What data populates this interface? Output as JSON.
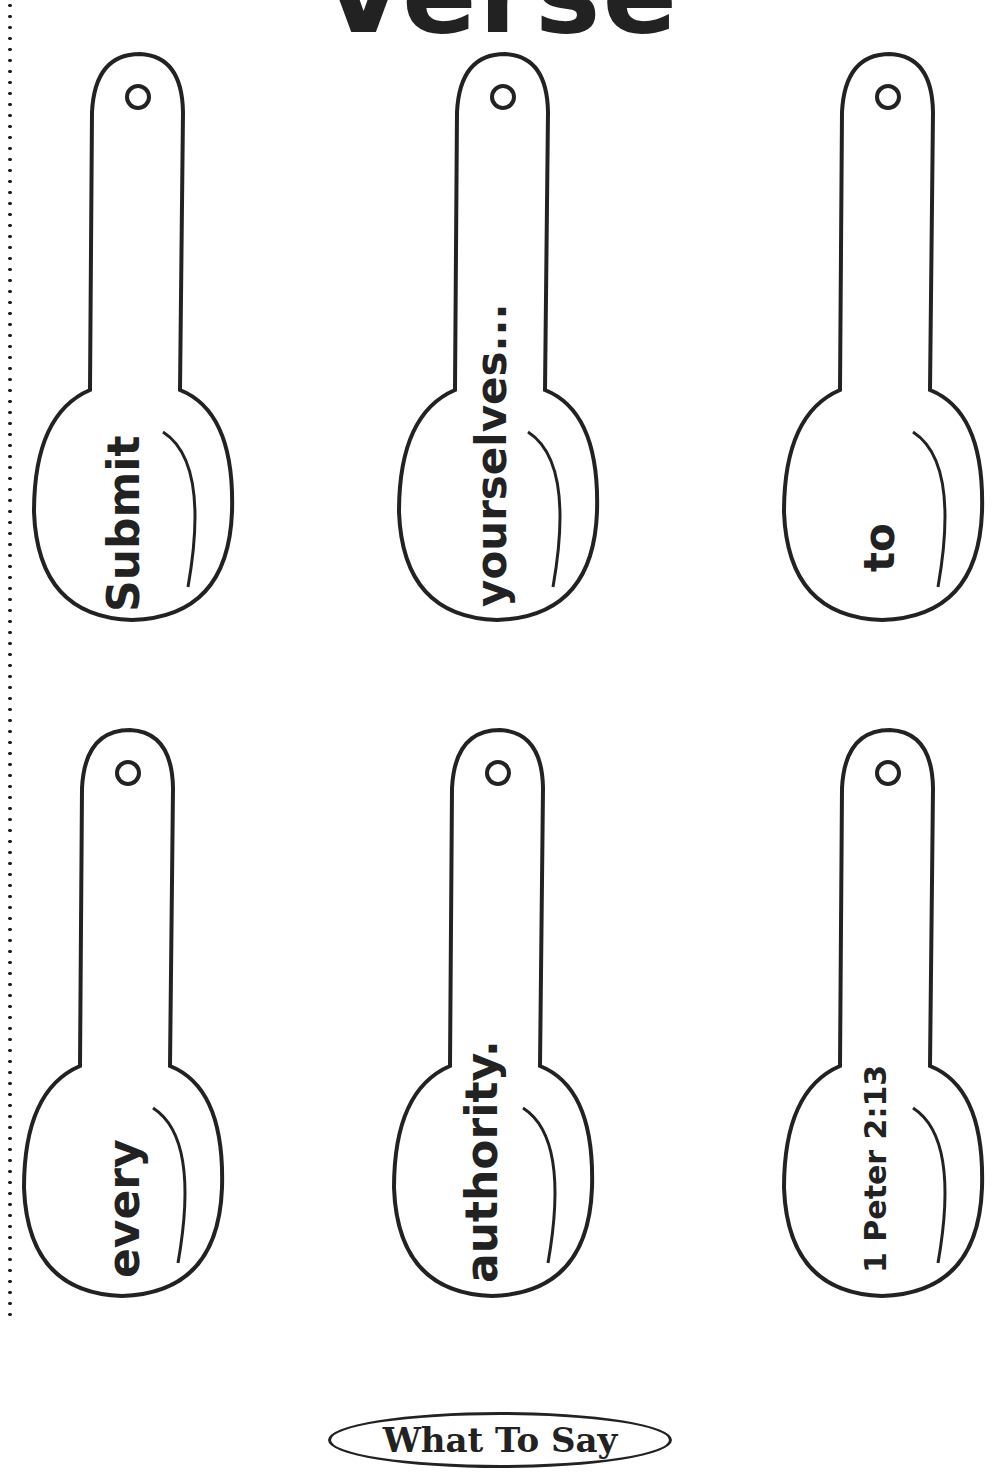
{
  "page": {
    "title": "Verse",
    "footer_label": "What To Say"
  },
  "spoons": [
    {
      "word": "Submit"
    },
    {
      "word": "yourselves..."
    },
    {
      "word": "to"
    },
    {
      "word": "every"
    },
    {
      "word": "authority."
    },
    {
      "word": "1 Peter 2:13"
    }
  ]
}
